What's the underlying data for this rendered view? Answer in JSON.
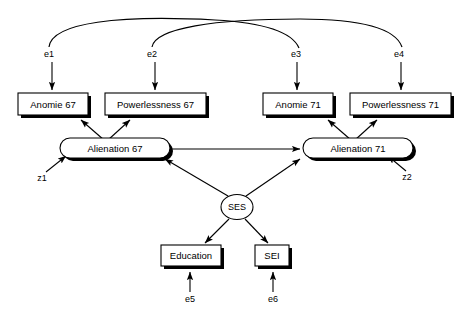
{
  "diagram": {
    "type": "path-diagram",
    "observed_variables": [
      {
        "id": "anomie67",
        "label": "Anomie 67"
      },
      {
        "id": "powerlessness67",
        "label": "Powerlessness 67"
      },
      {
        "id": "anomie71",
        "label": "Anomie 71"
      },
      {
        "id": "powerlessness71",
        "label": "Powerlessness 71"
      },
      {
        "id": "education",
        "label": "Education"
      },
      {
        "id": "sei",
        "label": "SEI"
      }
    ],
    "latent_variables": [
      {
        "id": "alienation67",
        "label": "Alienation 67"
      },
      {
        "id": "alienation71",
        "label": "Alienation 71"
      },
      {
        "id": "ses",
        "label": "SES"
      }
    ],
    "error_terms": [
      {
        "id": "e1",
        "label": "e1"
      },
      {
        "id": "e2",
        "label": "e2"
      },
      {
        "id": "e3",
        "label": "e3"
      },
      {
        "id": "e4",
        "label": "e4"
      },
      {
        "id": "e5",
        "label": "e5"
      },
      {
        "id": "e6",
        "label": "e6"
      }
    ],
    "disturbance_terms": [
      {
        "id": "z1",
        "label": "z1"
      },
      {
        "id": "z2",
        "label": "z2"
      }
    ],
    "correlated_errors": [
      {
        "from": "e1",
        "to": "e3"
      },
      {
        "from": "e2",
        "to": "e4"
      }
    ],
    "colors": {
      "stroke": "#000000",
      "fill": "#ffffff",
      "background": "#ffffff"
    }
  }
}
